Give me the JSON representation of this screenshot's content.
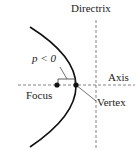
{
  "diagram": {
    "type": "parabola-geometry",
    "labels": {
      "directrix": "Directrix",
      "parameter": "p < 0",
      "axis": "Axis",
      "focus": "Focus",
      "vertex": "Vertex"
    },
    "colors": {
      "curve": "#111111",
      "dashed_lines": "#555555",
      "text": "#222222"
    }
  }
}
